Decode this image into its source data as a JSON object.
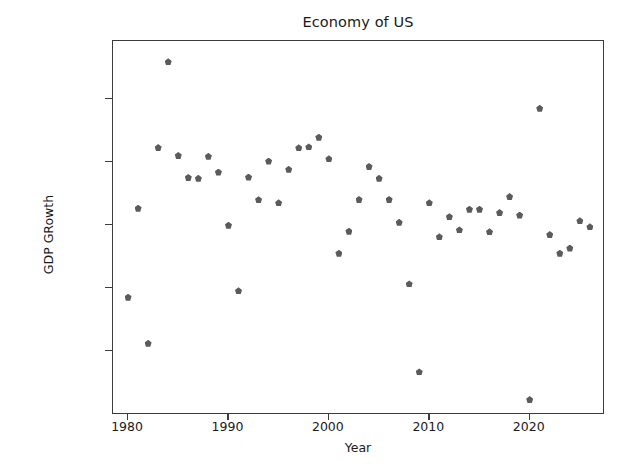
{
  "chart_data": {
    "type": "scatter",
    "title": "Economy of US",
    "xlabel": "Year",
    "ylabel": "GDP GRowth",
    "xlim": [
      1978.5,
      2027.5
    ],
    "ylim": [
      -0.0405,
      0.0785
    ],
    "grid": false,
    "legend": null,
    "marker": "pentagon",
    "marker_color": "#5b5b5b",
    "xticks": [
      1980,
      1990,
      2000,
      2010,
      2020
    ],
    "xtick_labels": [
      "1980",
      "1990",
      "2000",
      "2010",
      "2020"
    ],
    "yticks": [
      0.06,
      0.04,
      0.02,
      0.0,
      -0.02
    ],
    "ytick_labels": [
      "0.06",
      "0.04",
      "0.02",
      "0.00",
      "-0.02"
    ],
    "x": [
      1980,
      1981,
      1982,
      1983,
      1984,
      1985,
      1986,
      1987,
      1988,
      1989,
      1990,
      1991,
      1992,
      1993,
      1994,
      1995,
      1996,
      1997,
      1998,
      1999,
      2000,
      2001,
      2002,
      2003,
      2004,
      2005,
      2006,
      2007,
      2008,
      2009,
      2010,
      2011,
      2012,
      2013,
      2014,
      2015,
      2016,
      2017,
      2018,
      2019,
      2020,
      2021,
      2022,
      2023,
      2024,
      2025,
      2026
    ],
    "y": [
      -0.003,
      0.0253,
      -0.0177,
      0.0446,
      0.0719,
      0.0421,
      0.0351,
      0.0348,
      0.0418,
      0.0368,
      0.0199,
      -0.001,
      0.0352,
      0.028,
      0.0403,
      0.027,
      0.0377,
      0.0445,
      0.0448,
      0.0479,
      0.041,
      0.011,
      0.018,
      0.0281,
      0.0386,
      0.0348,
      0.0281,
      0.0208,
      0.0012,
      -0.0268,
      0.027,
      0.0162,
      0.0226,
      0.0184,
      0.025,
      0.025,
      0.0178,
      0.0239,
      0.029,
      0.0231,
      -0.0356,
      0.0571,
      0.0169,
      0.011,
      0.0126,
      0.0213,
      0.0194
    ],
    "points": [
      {
        "year": 1980,
        "value": -0.003
      },
      {
        "year": 1981,
        "value": 0.0253
      },
      {
        "year": 1982,
        "value": -0.0177
      },
      {
        "year": 1983,
        "value": 0.0446
      },
      {
        "year": 1984,
        "value": 0.0719
      },
      {
        "year": 1985,
        "value": 0.0421
      },
      {
        "year": 1986,
        "value": 0.0351
      },
      {
        "year": 1987,
        "value": 0.0348
      },
      {
        "year": 1988,
        "value": 0.0418
      },
      {
        "year": 1989,
        "value": 0.0368
      },
      {
        "year": 1990,
        "value": 0.0199
      },
      {
        "year": 1991,
        "value": -0.001
      },
      {
        "year": 1992,
        "value": 0.0352
      },
      {
        "year": 1993,
        "value": 0.028
      },
      {
        "year": 1994,
        "value": 0.0403
      },
      {
        "year": 1995,
        "value": 0.027
      },
      {
        "year": 1996,
        "value": 0.0377
      },
      {
        "year": 1997,
        "value": 0.0445
      },
      {
        "year": 1998,
        "value": 0.0448
      },
      {
        "year": 1999,
        "value": 0.0479
      },
      {
        "year": 2000,
        "value": 0.041
      },
      {
        "year": 2001,
        "value": 0.011
      },
      {
        "year": 2002,
        "value": 0.018
      },
      {
        "year": 2003,
        "value": 0.0281
      },
      {
        "year": 2004,
        "value": 0.0386
      },
      {
        "year": 2005,
        "value": 0.0348
      },
      {
        "year": 2006,
        "value": 0.0281
      },
      {
        "year": 2007,
        "value": 0.0208
      },
      {
        "year": 2008,
        "value": 0.0012
      },
      {
        "year": 2009,
        "value": -0.0268
      },
      {
        "year": 2010,
        "value": 0.027
      },
      {
        "year": 2011,
        "value": 0.0162
      },
      {
        "year": 2012,
        "value": 0.0226
      },
      {
        "year": 2013,
        "value": 0.0184
      },
      {
        "year": 2014,
        "value": 0.025
      },
      {
        "year": 2015,
        "value": 0.025
      },
      {
        "year": 2016,
        "value": 0.0178
      },
      {
        "year": 2017,
        "value": 0.0239
      },
      {
        "year": 2018,
        "value": 0.029
      },
      {
        "year": 2019,
        "value": 0.0231
      },
      {
        "year": 2020,
        "value": -0.0356
      },
      {
        "year": 2021,
        "value": 0.0571
      },
      {
        "year": 2022,
        "value": 0.0169
      },
      {
        "year": 2023,
        "value": 0.011
      },
      {
        "year": 2024,
        "value": 0.0126
      },
      {
        "year": 2025,
        "value": 0.0213
      },
      {
        "year": 2026,
        "value": 0.0194
      }
    ]
  }
}
